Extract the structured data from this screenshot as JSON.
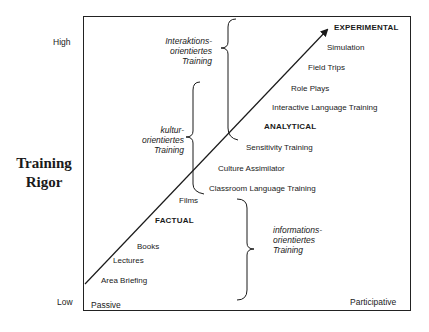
{
  "y_axis": {
    "title_line1": "Training",
    "title_line2": "Rigor",
    "high_label": "High",
    "low_label": "Low"
  },
  "x_axis": {
    "left_label": "Passive",
    "right_label": "Participative"
  },
  "categories": {
    "experimental": "EXPERIMENTAL",
    "analytical": "ANALYTICAL",
    "factual": "FACTUAL"
  },
  "methods": {
    "simulation": "Simulation",
    "field_trips": "Field Trips",
    "role_plays": "Role Plays",
    "interactive_language_training": "Interactive Language Training",
    "sensitivity_training": "Sensitivity Training",
    "culture_assimilator": "Culture Assimilator",
    "classroom_language_training": "Classroom Language Training",
    "films": "Films",
    "books": "Books",
    "lectures": "Lectures",
    "area_briefing": "Area Briefing"
  },
  "groupings": {
    "interaktions": {
      "line1": "Interaktions-",
      "line2": "orientiertes",
      "line3": "Training"
    },
    "kultur": {
      "line1": "kultur-",
      "line2": "orientiertes",
      "line3": "Training"
    },
    "informations": {
      "line1": "informations-",
      "line2": "orientiertes",
      "line3": "Training"
    }
  },
  "colors": {
    "line": "#1a1a1a",
    "background": "#ffffff"
  }
}
